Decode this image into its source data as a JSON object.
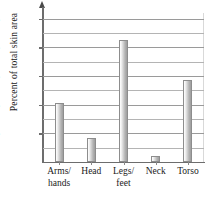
{
  "chart_data": {
    "type": "bar",
    "title": "",
    "xlabel": "",
    "ylabel": "Percent of total skin area",
    "categories": [
      "Arms/\nhands",
      "Head",
      "Legs/\nfeet",
      "Neck",
      "Torso"
    ],
    "values": [
      20.5,
      8.5,
      42.5,
      2.0,
      28.5
    ],
    "ylim": [
      0,
      52
    ],
    "ytick_values": [
      10,
      20,
      30,
      40,
      50
    ],
    "ytick_labels": [
      "10%",
      "20%",
      "30%",
      "40%",
      "50%"
    ],
    "gridline_values": [
      5,
      10,
      15,
      20,
      25,
      30,
      35,
      40,
      45,
      50
    ],
    "grid": true,
    "legend": "none",
    "bar_color": "#c8c8c8",
    "bar_edge_color": "#8d8d8d",
    "axis_color": "#6d6d6d",
    "grid_color": "#b4b4b4",
    "background": "#ffffff"
  }
}
